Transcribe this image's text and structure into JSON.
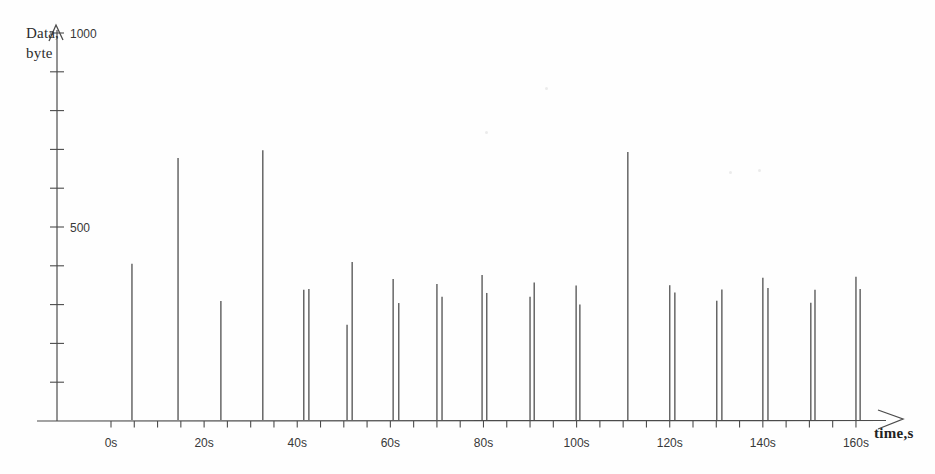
{
  "chart_data": {
    "type": "stem",
    "title": "",
    "ylabel": "Data, byte",
    "ylabel_lines": [
      "Data,",
      "byte"
    ],
    "xlabel": "time,s",
    "x_unit": "s",
    "y_unit": "byte",
    "xlim": [
      0,
      170
    ],
    "ylim": [
      0,
      1050
    ],
    "grid": false,
    "legend": null,
    "x_tick_step": 5,
    "x_tick_max": 160,
    "y_tick_step": 100,
    "y_tick_max": 1000,
    "x_ticks_labeled": [
      {
        "t": 0,
        "label": "0s"
      },
      {
        "t": 20,
        "label": "20s"
      },
      {
        "t": 40,
        "label": "40s"
      },
      {
        "t": 60,
        "label": "60s"
      },
      {
        "t": 80,
        "label": "80s"
      },
      {
        "t": 100,
        "label": "100s"
      },
      {
        "t": 120,
        "label": "120s"
      },
      {
        "t": 140,
        "label": "140s"
      },
      {
        "t": 160,
        "label": "160s"
      }
    ],
    "y_ticks_labeled": [
      {
        "v": 500,
        "label": "500"
      },
      {
        "v": 1000,
        "label": "1000"
      }
    ],
    "points": [
      {
        "t": 4.5,
        "bytes": 405
      },
      {
        "t": 14.4,
        "bytes": 678
      },
      {
        "t": 23.6,
        "bytes": 309
      },
      {
        "t": 32.6,
        "bytes": 698
      },
      {
        "t": 41.4,
        "bytes": 338
      },
      {
        "t": 42.5,
        "bytes": 340
      },
      {
        "t": 50.7,
        "bytes": 248
      },
      {
        "t": 51.8,
        "bytes": 410
      },
      {
        "t": 60.6,
        "bytes": 366
      },
      {
        "t": 61.8,
        "bytes": 304
      },
      {
        "t": 70.0,
        "bytes": 353
      },
      {
        "t": 71.1,
        "bytes": 320
      },
      {
        "t": 79.7,
        "bytes": 376
      },
      {
        "t": 80.7,
        "bytes": 330
      },
      {
        "t": 90.0,
        "bytes": 320
      },
      {
        "t": 90.9,
        "bytes": 357
      },
      {
        "t": 99.9,
        "bytes": 349
      },
      {
        "t": 100.7,
        "bytes": 300
      },
      {
        "t": 111.0,
        "bytes": 693
      },
      {
        "t": 120.0,
        "bytes": 350
      },
      {
        "t": 121.1,
        "bytes": 331
      },
      {
        "t": 130.1,
        "bytes": 310
      },
      {
        "t": 131.2,
        "bytes": 339
      },
      {
        "t": 140.0,
        "bytes": 369
      },
      {
        "t": 141.1,
        "bytes": 343
      },
      {
        "t": 150.3,
        "bytes": 305
      },
      {
        "t": 151.2,
        "bytes": 338
      },
      {
        "t": 160.0,
        "bytes": 372
      },
      {
        "t": 160.9,
        "bytes": 340
      }
    ],
    "colors": {
      "ink": "#4b4b4b",
      "text": "#383838",
      "paper": "#fefefe"
    }
  }
}
